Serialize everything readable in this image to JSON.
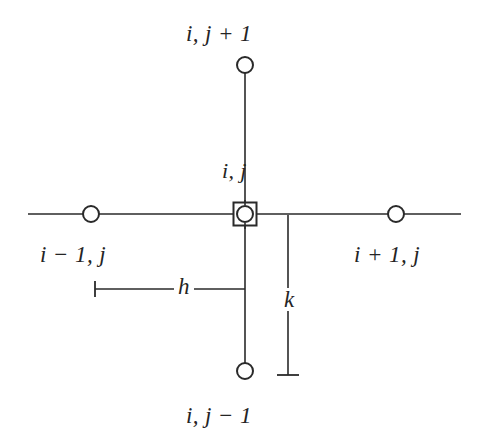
{
  "figure": {
    "kind": "finite-difference-grid-stencil",
    "background_color": "#ffffff",
    "stroke_color": "#2a2a2a",
    "text_color": "#242424"
  },
  "labels": {
    "top_node": "i, j + 1",
    "bottom_node": "i, j − 1",
    "left_node": "i − 1, j",
    "right_node": "i + 1, j",
    "center_node": "i, j",
    "horizontal_spacing": "h",
    "vertical_spacing": "k"
  },
  "nodes": [
    {
      "name": "center-node",
      "label": "i, j",
      "marker": "circle-in-square",
      "cx": 245,
      "cy": 214
    },
    {
      "name": "top-node",
      "label": "i, j + 1",
      "marker": "open-circle",
      "cx": 245,
      "cy": 65
    },
    {
      "name": "bottom-node",
      "label": "i, j − 1",
      "marker": "open-circle",
      "cx": 245,
      "cy": 371
    },
    {
      "name": "left-node",
      "label": "i − 1, j",
      "marker": "open-circle",
      "cx": 91,
      "cy": 214
    },
    {
      "name": "right-node",
      "label": "i + 1, j",
      "marker": "open-circle",
      "cx": 396,
      "cy": 214
    }
  ],
  "grid_lines": {
    "horizontal_axis": {
      "x1": 28,
      "y1": 214,
      "x2": 461,
      "y2": 214
    },
    "vertical_axis": {
      "x1": 245,
      "y1": 72,
      "x2": 245,
      "y2": 364
    }
  },
  "dimensions": [
    {
      "name": "h-dimension",
      "label": "h",
      "orientation": "horizontal",
      "line": {
        "x1": 95,
        "y1": 289,
        "x2": 245,
        "y2": 289
      },
      "tick_start": {
        "x": 95,
        "y1": 281,
        "y2": 297
      }
    },
    {
      "name": "k-dimension",
      "label": "k",
      "orientation": "vertical",
      "line": {
        "x1": 288,
        "y1": 214,
        "x2": 288,
        "y2": 375
      },
      "tick_end": {
        "y": 375,
        "x1": 277,
        "x2": 299
      }
    }
  ],
  "marker_geometry": {
    "open_circle_radius": 8,
    "center_circle_radius": 8,
    "center_square_size": 23,
    "line_width": 1.6,
    "marker_line_width": 2
  }
}
